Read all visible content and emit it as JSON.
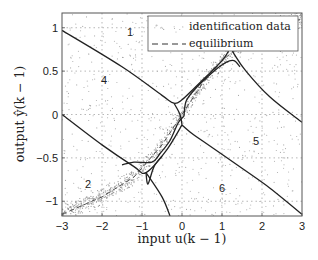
{
  "chart_data": {
    "type": "scatter",
    "title": "",
    "xlabel": "input u(k − 1)",
    "ylabel": "output ŷ(k − 1)",
    "xlim": [
      -3,
      3
    ],
    "ylim": [
      -1.17,
      1.17
    ],
    "grid": true,
    "legend_position": "top-right",
    "x_ticks": [
      -3,
      -2,
      -1,
      0,
      1,
      2,
      3
    ],
    "x_tick_labels": [
      "−3",
      "−2",
      "−1",
      "0",
      "1",
      "2",
      "3"
    ],
    "y_ticks": [
      1,
      0.5,
      0,
      -0.5,
      -1
    ],
    "y_tick_labels": [
      "1",
      "0.5",
      "0",
      "−0.5",
      "−1"
    ],
    "legend": [
      {
        "name": "identification data",
        "style": "dots"
      },
      {
        "name": "equilibrium",
        "style": "dashed"
      }
    ],
    "region_labels": [
      {
        "text": "1",
        "u": -1.3,
        "y": 0.95
      },
      {
        "text": "4",
        "u": -1.95,
        "y": 0.4
      },
      {
        "text": "5",
        "u": 1.85,
        "y": -0.3
      },
      {
        "text": "6",
        "u": 1.0,
        "y": -0.85
      },
      {
        "text": "2",
        "u": -2.35,
        "y": -0.8
      }
    ],
    "boundary_curves": [
      {
        "name": "upper-left boundary",
        "points": [
          [
            -3,
            0.97
          ],
          [
            -1.5,
            0.55
          ],
          [
            -0.5,
            0.22
          ],
          [
            -0.2,
            0.13
          ],
          [
            0.0,
            0.17
          ],
          [
            0.3,
            0.3
          ],
          [
            0.7,
            0.48
          ],
          [
            1.0,
            0.62
          ],
          [
            1.15,
            0.72
          ],
          [
            1.2,
            0.8
          ]
        ]
      },
      {
        "name": "upper-right boundary",
        "points": [
          [
            1.2,
            0.8
          ],
          [
            1.3,
            0.7
          ],
          [
            1.6,
            0.5
          ],
          [
            2.2,
            0.2
          ],
          [
            3.0,
            -0.09
          ]
        ]
      },
      {
        "name": "upper-right lobe",
        "points": [
          [
            0.05,
            -0.02
          ],
          [
            0.1,
            0.15
          ],
          [
            0.3,
            0.28
          ],
          [
            0.8,
            0.5
          ],
          [
            1.1,
            0.6
          ],
          [
            1.3,
            0.62
          ],
          [
            1.45,
            0.55
          ]
        ]
      },
      {
        "name": "lower-right boundary",
        "points": [
          [
            0.0,
            -0.12
          ],
          [
            0.2,
            -0.2
          ],
          [
            0.5,
            -0.3
          ],
          [
            1.5,
            -0.62
          ],
          [
            2.2,
            -0.85
          ],
          [
            3.0,
            -1.15
          ]
        ]
      },
      {
        "name": "lower-left boundary",
        "points": [
          [
            -3,
            0.0
          ],
          [
            -2.0,
            -0.35
          ],
          [
            -1.2,
            -0.6
          ],
          [
            -0.9,
            -0.67
          ],
          [
            -0.4,
            -0.42
          ],
          [
            0.0,
            -0.12
          ]
        ]
      },
      {
        "name": "lower-left lobe",
        "points": [
          [
            -1.5,
            -0.58
          ],
          [
            -1.2,
            -0.55
          ],
          [
            -0.75,
            -0.55
          ],
          [
            -0.55,
            -0.45
          ],
          [
            -0.3,
            -0.3
          ],
          [
            -0.1,
            -0.1
          ],
          [
            0.05,
            -0.02
          ]
        ]
      },
      {
        "name": "lower-left lobe 2",
        "points": [
          [
            -0.9,
            -0.67
          ],
          [
            -0.85,
            -0.8
          ],
          [
            -0.7,
            -0.6
          ],
          [
            -0.5,
            -0.48
          ]
        ]
      },
      {
        "name": "center link",
        "points": [
          [
            -0.2,
            0.13
          ],
          [
            -0.05,
            0.0
          ],
          [
            0.0,
            -0.12
          ]
        ]
      },
      {
        "name": "diagonal to bottom",
        "points": [
          [
            -0.9,
            -0.67
          ],
          [
            -0.5,
            -0.95
          ],
          [
            -0.3,
            -1.17
          ]
        ]
      }
    ],
    "equilibrium": {
      "points": [
        [
          -3,
          -1.15
        ],
        [
          -2.0,
          -0.95
        ],
        [
          -1.2,
          -0.72
        ],
        [
          -0.5,
          -0.35
        ],
        [
          0.0,
          0.0
        ],
        [
          0.5,
          0.35
        ],
        [
          1.0,
          0.62
        ],
        [
          1.6,
          0.85
        ],
        [
          2.3,
          1.02
        ],
        [
          3.0,
          1.1
        ]
      ]
    }
  }
}
